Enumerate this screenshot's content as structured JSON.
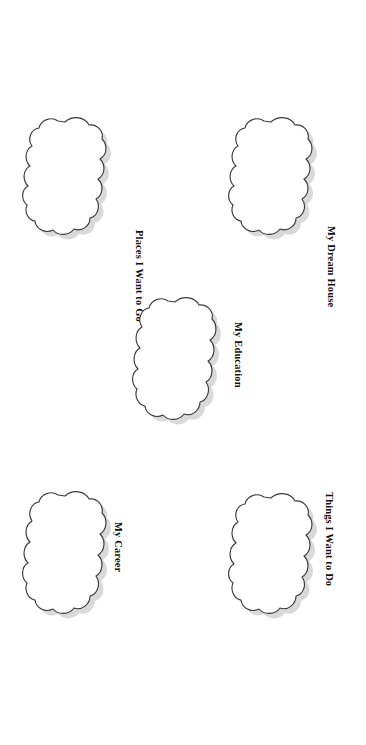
{
  "page": {
    "background_color": "#ffffff",
    "width": 366,
    "height": 745,
    "outline_color": "#3a3a3a",
    "shadow_color": "#b9b9b9",
    "label_color": "#111111"
  },
  "bubbles": [
    {
      "id": "places-i-want-to-go",
      "label": "Places I Want to Go",
      "shape": "scalloped-cloud",
      "position": "top-left"
    },
    {
      "id": "my-dream-house",
      "label": "My Dream House",
      "shape": "scalloped-cloud",
      "position": "top-right"
    },
    {
      "id": "my-education",
      "label": "My Education",
      "shape": "scalloped-cloud",
      "position": "center"
    },
    {
      "id": "my-career",
      "label": "My Career",
      "shape": "scalloped-cloud",
      "position": "bottom-left"
    },
    {
      "id": "things-i-want-to-do",
      "label": "Things I Want to Do",
      "shape": "scalloped-cloud",
      "position": "bottom-right"
    }
  ]
}
